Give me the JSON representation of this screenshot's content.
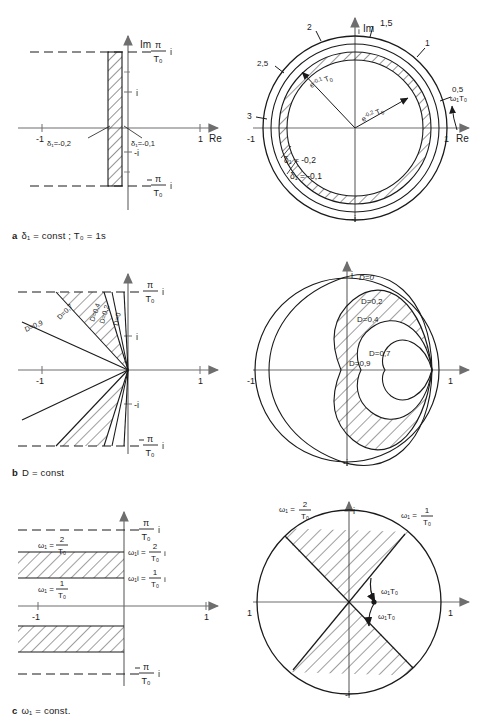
{
  "figure": {
    "title_hidden": "",
    "captions": [
      {
        "key": "a",
        "letter": "a",
        "text": "δ₁ = const ; T₀ = 1s"
      },
      {
        "key": "b",
        "letter": "b",
        "text": "D = const"
      },
      {
        "key": "c",
        "letter": "c",
        "text": "ω₁ = const."
      }
    ]
  },
  "axes": {
    "im": "Im",
    "re": "Re",
    "i": "i",
    "minus_i": "-i",
    "one": "1",
    "minus_one": "-1",
    "pi_over_T0_i": "π/T₀ i",
    "minus_pi_over_T0_i": "-π/T₀ i",
    "pi_num": "π",
    "pi_den": "T₀"
  },
  "row_a": {
    "left": {
      "plane": "s-plane",
      "band_labels": [
        {
          "name": "delta-left",
          "text": "δ₁=-0,2"
        },
        {
          "name": "delta-right",
          "text": "δ₁=-0,1"
        }
      ],
      "axis_ticks": [
        "-1",
        "1"
      ],
      "imag_ticks": [
        "i",
        "-i"
      ]
    },
    "right": {
      "plane": "z-plane",
      "radius_labels": [
        {
          "name": "radius-outer",
          "text": "e⁻⁰˙¹ T₀",
          "base": "e",
          "exp": "-0,1",
          "sub": "T₀"
        },
        {
          "name": "radius-inner",
          "text": "e⁻⁰˙² T₀",
          "base": "e",
          "exp": "-0,2",
          "sub": "T₀"
        }
      ],
      "delta_labels": [
        {
          "name": "delta-outer",
          "text": "δ₁ = -0,2"
        },
        {
          "name": "delta-inner",
          "text": "δ₁ = -0,1"
        }
      ],
      "omega_scale_label": "ω₁T₀",
      "scale_ticks": [
        "0,5",
        "1",
        "1,5",
        "2",
        "2,5",
        "3"
      ]
    }
  },
  "row_b": {
    "left": {
      "plane": "s-plane",
      "d_labels": [
        "D=0",
        "D=0,2",
        "D=0,4",
        "D=0,7",
        "D=0,9"
      ]
    },
    "right": {
      "plane": "z-plane",
      "d_labels": [
        "D=0",
        "D=0,2",
        "D=0,4",
        "D=0,7",
        "D=0,9"
      ]
    }
  },
  "row_c": {
    "left": {
      "plane": "s-plane",
      "band_labels": [
        {
          "name": "omega-upper",
          "num": "2",
          "den": "T₀",
          "prefix": "ω₁ ="
        },
        {
          "name": "omega-lower",
          "num": "1",
          "den": "T₀",
          "prefix": "ω₁ ="
        }
      ],
      "axis_labels": [
        {
          "name": "omega-i-upper",
          "prefix": "ω₁i =",
          "num": "2",
          "den": "T₀",
          "suffix": "i"
        },
        {
          "name": "omega-i-lower",
          "prefix": "ω₁i =",
          "num": "1",
          "den": "T₀",
          "suffix": "i"
        }
      ]
    },
    "right": {
      "plane": "z-plane",
      "ray_labels": [
        {
          "name": "omega-2",
          "prefix": "ω₁ =",
          "num": "2",
          "den": "T₀"
        },
        {
          "name": "omega-1",
          "prefix": "ω₁ =",
          "num": "1",
          "den": "T₀"
        }
      ],
      "arc_labels": [
        "ω₁T₀",
        "ω₁T₀"
      ]
    }
  },
  "style": {
    "ink": "#1a1a1a",
    "axis": "#6e6e6e",
    "hatch": "#2a2a2a"
  }
}
